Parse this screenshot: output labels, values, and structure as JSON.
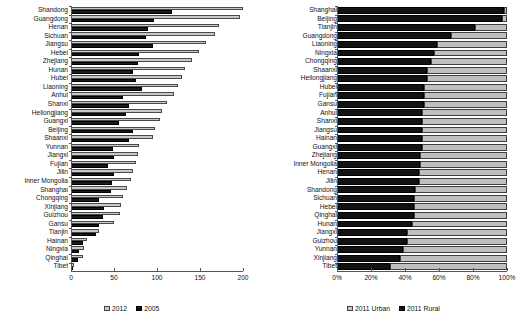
{
  "chart_data": [
    {
      "type": "bar",
      "panel": "left",
      "title": "",
      "orientation": "horizontal",
      "xlabel": "",
      "ylabel": "",
      "xlim": [
        0,
        200
      ],
      "xticks": [
        0,
        50,
        100,
        150,
        200
      ],
      "xtick_labels": [
        "0",
        "50",
        "100",
        "150",
        "200"
      ],
      "grid": false,
      "legend_position": "bottom",
      "legend": [
        "2012",
        "2005"
      ],
      "colors": {
        "2012": "#c9c9c9",
        "2005": "#1b1b1b"
      },
      "categories": [
        "Shandong",
        "Guangdong",
        "Henan",
        "Sichuan",
        "Jiangsu",
        "Hebei",
        "Zhejiang",
        "Hunan",
        "Hubei",
        "Liaoning",
        "Anhui",
        "Shanxi",
        "Heilongjiang",
        "Guangxi",
        "Beijing",
        "Shaanxi",
        "Yunnan",
        "Jiangxi",
        "Fujian",
        "Jilin",
        "Inner Mongolia",
        "Shanghai",
        "Chongqing",
        "Xinjiang",
        "Guizhou",
        "Gansu",
        "Tianjin",
        "Hainan",
        "Ningxia",
        "Qinghai",
        "Tibet"
      ],
      "series": [
        {
          "name": "2012",
          "values": [
            200,
            196,
            172,
            168,
            157,
            149,
            141,
            133,
            129,
            124,
            120,
            112,
            106,
            104,
            98,
            95,
            79,
            78,
            76,
            72,
            70,
            65,
            61,
            58,
            57,
            50,
            33,
            19,
            15,
            14,
            3
          ]
        },
        {
          "name": "2005",
          "values": [
            117,
            96,
            90,
            87,
            95,
            79,
            78,
            72,
            75,
            82,
            61,
            68,
            64,
            56,
            72,
            68,
            49,
            50,
            43,
            50,
            48,
            46,
            32,
            38,
            37,
            33,
            29,
            14,
            9,
            8,
            2
          ]
        }
      ]
    },
    {
      "type": "bar",
      "panel": "right",
      "title": "",
      "orientation": "horizontal",
      "stacked": true,
      "stack_mode": "percent",
      "xlabel": "",
      "ylabel": "",
      "xlim": [
        0,
        100
      ],
      "xticks": [
        0,
        20,
        40,
        60,
        80,
        100
      ],
      "xtick_labels": [
        "0%",
        "20%",
        "40%",
        "60%",
        "80%",
        "100%"
      ],
      "grid": false,
      "legend_position": "bottom",
      "legend": [
        "2011 Urban",
        "2011 Rural"
      ],
      "colors": {
        "2011 Urban": "#bfbfbf",
        "2011 Rural": "#121212"
      },
      "categories": [
        "Shanghai",
        "Beijing",
        "Tianjin",
        "Guangdong",
        "Liaoning",
        "Ningxia",
        "Chongqing",
        "Shaanxi",
        "Heilongjiang",
        "Hubei",
        "Fujian",
        "Gansu",
        "Anhui",
        "Shanxi",
        "Jiangsu",
        "Hainan",
        "Guangxi",
        "Zhejiang",
        "Inner Mongolia",
        "Henan",
        "Jilin",
        "Shandong",
        "Sichuan",
        "Hebei",
        "Qinghai",
        "Hunan",
        "Jiangxi",
        "Guizhou",
        "Yunnan",
        "Xinjiang",
        "Tibet"
      ],
      "series": [
        {
          "name": "2011 Rural",
          "values": [
            98,
            97,
            81,
            67,
            59,
            57,
            55,
            53,
            53,
            51,
            51,
            51,
            50,
            50,
            50,
            50,
            50,
            49,
            49,
            48,
            48,
            46,
            45,
            45,
            45,
            44,
            41,
            41,
            39,
            37,
            31
          ]
        },
        {
          "name": "2011 Urban",
          "values": [
            2,
            3,
            19,
            33,
            41,
            43,
            45,
            47,
            47,
            49,
            49,
            49,
            50,
            50,
            50,
            50,
            50,
            51,
            51,
            52,
            52,
            54,
            55,
            55,
            55,
            56,
            59,
            59,
            61,
            63,
            69
          ]
        }
      ]
    }
  ],
  "left_panel": {
    "legend": {
      "items": [
        {
          "label": "2012",
          "swatch": "light"
        },
        {
          "label": "2005",
          "swatch": "dark"
        }
      ]
    },
    "axis": {
      "tick_labels": [
        "0",
        "50",
        "100",
        "150",
        "200"
      ]
    }
  },
  "right_panel": {
    "legend": {
      "items": [
        {
          "label": "2011 Urban",
          "swatch": "light"
        },
        {
          "label": "2011 Rural",
          "swatch": "dark"
        }
      ]
    },
    "axis": {
      "tick_labels": [
        "0%",
        "20%",
        "40%",
        "60%",
        "80%",
        "100%"
      ]
    }
  }
}
